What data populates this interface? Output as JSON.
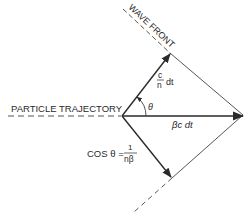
{
  "diagram": {
    "labels": {
      "wave_front": "WAVE FRONT",
      "particle_trajectory": "PARTICLE TRAJECTORY",
      "theta": "θ",
      "light_vector_num": "c",
      "light_vector_den": "n",
      "light_vector_suffix": "dt",
      "particle_vector": "βc dt",
      "cos_lhs": "COS θ =",
      "cos_num": "1",
      "cos_den": "nβ"
    },
    "colors": {
      "stroke": "#2a2a2a",
      "background": "#ffffff"
    }
  }
}
